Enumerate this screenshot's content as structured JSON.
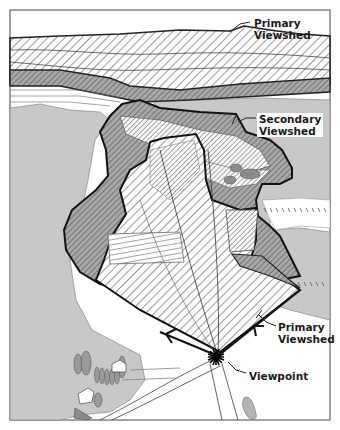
{
  "figure": {
    "type": "viewshed illustration",
    "labels": {
      "primary_viewshed_top": [
        "Primary",
        "Viewshed"
      ],
      "secondary_viewshed": [
        "Secondary",
        "Viewshed"
      ],
      "primary_viewshed_bottom": [
        "Primary",
        "Viewshed"
      ],
      "viewpoint": "Viewpoint"
    },
    "colors": {
      "background": "#ffffff",
      "outline": "#1a1a1a",
      "gray_land": "#c8c8c8",
      "dark_gray": "#9a9a9a",
      "hatch": "#333333"
    }
  }
}
